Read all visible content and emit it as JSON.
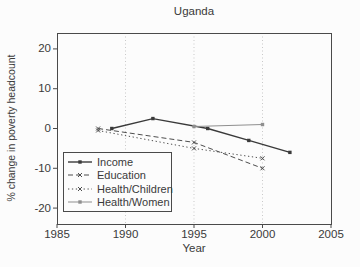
{
  "figure": {
    "background": "#fcfcfc",
    "text_color": "#3a3a3a"
  },
  "chart_data": {
    "type": "line",
    "title": "Uganda",
    "xlabel": "Year",
    "ylabel": "% change in poverty headcount",
    "xlim": [
      1985,
      2005
    ],
    "ylim": [
      -24,
      24
    ],
    "xticks": [
      1985,
      1990,
      1995,
      2000,
      2005
    ],
    "yticks": [
      20,
      10,
      0,
      -10,
      -20
    ],
    "grid_x": [
      1990,
      1995,
      2000
    ],
    "grid_style": "dotted",
    "frame": true,
    "legend_position": "lower-left",
    "colors": {
      "frame": "#4a4a4a",
      "grid": "#c9c9c9",
      "background": "#fcfcfc"
    },
    "series": [
      {
        "name": "Income",
        "line": "solid",
        "marker": "square",
        "color": "#3a3a3a",
        "width": 1.4,
        "points": [
          [
            1989,
            0
          ],
          [
            1992,
            2.5
          ],
          [
            1996,
            0
          ],
          [
            1999,
            -3
          ],
          [
            2002,
            -6
          ]
        ]
      },
      {
        "name": "Education",
        "line": "dashed",
        "marker": "x",
        "color": "#4d4d4d",
        "width": 1,
        "points": [
          [
            1988,
            0
          ],
          [
            1995,
            -3.5
          ],
          [
            2000,
            -10
          ]
        ]
      },
      {
        "name": "Health/Children",
        "line": "dotted",
        "marker": "x",
        "color": "#4d4d4d",
        "width": 1,
        "points": [
          [
            1988,
            -0.5
          ],
          [
            1995,
            -5
          ],
          [
            2000,
            -7.5
          ]
        ]
      },
      {
        "name": "Health/Women",
        "line": "solid",
        "marker": "square",
        "color": "#8f8f8f",
        "width": 1,
        "points": [
          [
            1995,
            0.5
          ],
          [
            2000,
            1
          ]
        ]
      }
    ]
  }
}
